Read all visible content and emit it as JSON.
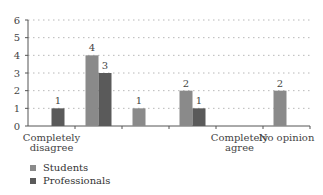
{
  "chart_data": {
    "type": "bar",
    "title": "",
    "xlabel": "",
    "ylabel": "",
    "ylim": [
      0,
      6
    ],
    "yticks": [
      0,
      1,
      2,
      3,
      4,
      5,
      6
    ],
    "grid": true,
    "categories": [
      "Completely disagree",
      "",
      "",
      "",
      "Completely agree",
      "No opinion"
    ],
    "category_lines": [
      [
        "Completely",
        "disagree"
      ],
      [],
      [],
      [],
      [
        "Completely",
        "agree"
      ],
      [
        "No opinion"
      ]
    ],
    "series": [
      {
        "name": "Students",
        "color": "#8a8a8a",
        "values": [
          0,
          4,
          1,
          2,
          0,
          2
        ]
      },
      {
        "name": "Professionals",
        "color": "#5a5a5a",
        "values": [
          1,
          3,
          0,
          1,
          0,
          0
        ]
      }
    ],
    "legend_position": "bottom-left"
  },
  "legend": {
    "items": [
      {
        "label": "Students",
        "color": "#8a8a8a"
      },
      {
        "label": "Professionals",
        "color": "#5a5a5a"
      }
    ]
  }
}
